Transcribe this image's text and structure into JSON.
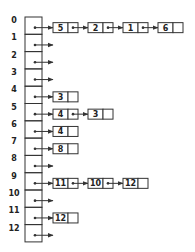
{
  "colors": {
    "stroke": "#333333",
    "background": "#ffffff"
  },
  "rows": [
    {
      "index": "0",
      "list": [
        "5",
        "2",
        "1",
        "6"
      ]
    },
    {
      "index": "1",
      "list": []
    },
    {
      "index": "2",
      "list": []
    },
    {
      "index": "3",
      "list": []
    },
    {
      "index": "4",
      "list": [
        "3"
      ]
    },
    {
      "index": "5",
      "list": [
        "4",
        "3"
      ]
    },
    {
      "index": "6",
      "list": [
        "4"
      ]
    },
    {
      "index": "7",
      "list": [
        "8"
      ]
    },
    {
      "index": "8",
      "list": []
    },
    {
      "index": "9",
      "list": [
        "11",
        "10",
        "12"
      ]
    },
    {
      "index": "10",
      "list": []
    },
    {
      "index": "11",
      "list": [
        "12"
      ]
    },
    {
      "index": "12",
      "list": []
    }
  ]
}
